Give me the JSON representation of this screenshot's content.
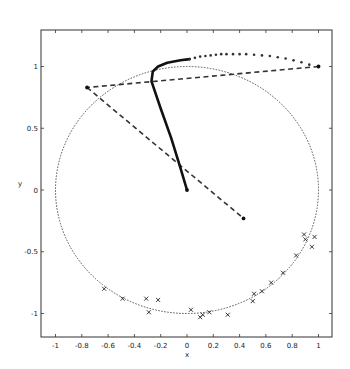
{
  "chart_data": {
    "type": "scatter",
    "title": "",
    "xlabel": "x",
    "ylabel": "y",
    "xlim": [
      -1.1,
      1.1
    ],
    "ylim": [
      -1.2,
      1.25
    ],
    "grid": false,
    "legend": null,
    "xticks": [
      -1,
      -0.8,
      -0.6,
      -0.4,
      -0.2,
      0,
      0.2,
      0.4,
      0.6,
      0.8,
      1
    ],
    "xtick_labels": [
      "-1",
      "-0.8",
      "-0.6",
      "-0.4",
      "-0.2",
      "0",
      "0.2",
      "0.4",
      "0.6",
      "0.8",
      "1"
    ],
    "yticks": [
      -1,
      -0.5,
      0,
      0.5,
      1
    ],
    "ytick_labels": [
      "-1",
      "-0.5",
      "0",
      "0.5",
      "1"
    ],
    "series": [
      {
        "name": "unit-circle",
        "style": "dotted",
        "kind": "circle",
        "center": [
          0,
          0
        ],
        "radius": 1
      },
      {
        "name": "trajectory-thick",
        "style": "solid-thick",
        "points": [
          [
            0.0,
            0.0
          ],
          [
            -0.05,
            0.18
          ],
          [
            -0.12,
            0.42
          ],
          [
            -0.2,
            0.66
          ],
          [
            -0.27,
            0.88
          ],
          [
            -0.26,
            0.96
          ],
          [
            -0.22,
            1.0
          ],
          [
            -0.15,
            1.03
          ],
          [
            -0.05,
            1.05
          ],
          [
            0.02,
            1.06
          ]
        ]
      },
      {
        "name": "trajectory-markers",
        "style": "dots",
        "points": [
          [
            0.02,
            1.06
          ],
          [
            0.06,
            1.07
          ],
          [
            0.1,
            1.08
          ],
          [
            0.14,
            1.085
          ],
          [
            0.18,
            1.09
          ],
          [
            0.22,
            1.095
          ],
          [
            0.26,
            1.1
          ],
          [
            0.3,
            1.1
          ],
          [
            0.35,
            1.1
          ],
          [
            0.4,
            1.1
          ],
          [
            0.45,
            1.1
          ],
          [
            0.51,
            1.095
          ],
          [
            0.57,
            1.09
          ],
          [
            0.63,
            1.085
          ],
          [
            0.69,
            1.075
          ],
          [
            0.75,
            1.065
          ],
          [
            0.81,
            1.05
          ],
          [
            0.87,
            1.035
          ],
          [
            0.93,
            1.015
          ],
          [
            1.0,
            1.0
          ]
        ]
      },
      {
        "name": "dashed-segments",
        "style": "dashed",
        "segments": [
          [
            [
              1.0,
              1.0
            ],
            [
              -0.76,
              0.83
            ]
          ],
          [
            [
              -0.76,
              0.83
            ],
            [
              0.43,
              -0.23
            ]
          ]
        ]
      },
      {
        "name": "endpoints",
        "style": "filled-dot",
        "points": [
          [
            1.0,
            1.0
          ],
          [
            -0.76,
            0.83
          ],
          [
            0.43,
            -0.23
          ],
          [
            0.0,
            0.0
          ]
        ]
      },
      {
        "name": "samples",
        "style": "x-marker",
        "points": [
          [
            -0.63,
            -0.8
          ],
          [
            -0.49,
            -0.88
          ],
          [
            -0.31,
            -0.88
          ],
          [
            -0.29,
            -0.99
          ],
          [
            -0.22,
            -0.89
          ],
          [
            0.03,
            -0.97
          ],
          [
            0.1,
            -1.03
          ],
          [
            0.12,
            -1.01
          ],
          [
            0.17,
            -0.99
          ],
          [
            0.31,
            -1.01
          ],
          [
            0.5,
            -0.9
          ],
          [
            0.51,
            -0.84
          ],
          [
            0.57,
            -0.82
          ],
          [
            0.64,
            -0.75
          ],
          [
            0.73,
            -0.67
          ],
          [
            0.83,
            -0.53
          ],
          [
            0.89,
            -0.36
          ],
          [
            0.9,
            -0.4
          ],
          [
            0.95,
            -0.46
          ],
          [
            0.97,
            -0.38
          ]
        ]
      }
    ]
  },
  "layout": {
    "frame": {
      "left": 41,
      "top": 30,
      "right": 332,
      "bottom": 337
    },
    "x_origin_px": 187,
    "y_origin_px": 190,
    "px_per_unit_x": 131.5,
    "px_per_unit_y": 123.5
  },
  "colors": {
    "ink": "#111111",
    "axis": "#333333",
    "background": "#ffffff"
  }
}
